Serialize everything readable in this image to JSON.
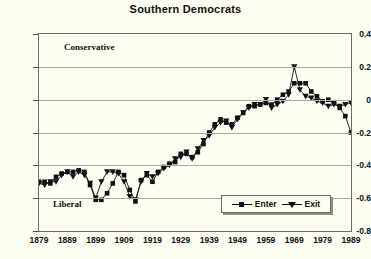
{
  "chart_data": {
    "type": "line",
    "title": "Southern Democrats",
    "xlabel": "",
    "ylabel": "",
    "xlim": [
      1879,
      1989
    ],
    "ylim": [
      -0.8,
      0.4
    ],
    "yticks": [
      0.4,
      0.2,
      0,
      -0.2,
      -0.4,
      -0.6,
      -0.8
    ],
    "ytick_labels": [
      "0.4",
      "0.2",
      "0",
      "-0.2",
      "-0.4",
      "-0.6",
      "-0.8"
    ],
    "xticks": [
      1879,
      1889,
      1899,
      1909,
      1919,
      1929,
      1939,
      1949,
      1959,
      1969,
      1979,
      1989
    ],
    "xtick_labels": [
      "1879",
      "1889",
      "1899",
      "1909",
      "1919",
      "1929",
      "1939",
      "1949",
      "1959",
      "1969",
      "1979",
      "1989"
    ],
    "grid": "horizontal",
    "legend_position": "inside-bottom-right",
    "annotations": [
      {
        "text": "Conservative",
        "x": 1888,
        "y": 0.33
      },
      {
        "text": "Liberal",
        "x": 1885,
        "y": -0.64
      }
    ],
    "series": [
      {
        "name": "Enter",
        "marker": "square",
        "x": [
          1879,
          1881,
          1883,
          1885,
          1887,
          1889,
          1891,
          1893,
          1895,
          1897,
          1899,
          1901,
          1903,
          1905,
          1907,
          1909,
          1911,
          1913,
          1915,
          1917,
          1919,
          1921,
          1923,
          1925,
          1927,
          1929,
          1931,
          1933,
          1935,
          1937,
          1939,
          1941,
          1943,
          1945,
          1947,
          1949,
          1951,
          1953,
          1955,
          1957,
          1959,
          1961,
          1963,
          1965,
          1967,
          1969,
          1971,
          1973,
          1975,
          1977,
          1979,
          1981,
          1983,
          1985,
          1987,
          1989
        ],
        "values": [
          -0.5,
          -0.5,
          -0.51,
          -0.47,
          -0.45,
          -0.44,
          -0.44,
          -0.43,
          -0.44,
          -0.52,
          -0.61,
          -0.61,
          -0.57,
          -0.51,
          -0.44,
          -0.46,
          -0.55,
          -0.62,
          -0.49,
          -0.46,
          -0.5,
          -0.44,
          -0.41,
          -0.39,
          -0.38,
          -0.33,
          -0.33,
          -0.35,
          -0.32,
          -0.27,
          -0.2,
          -0.15,
          -0.12,
          -0.14,
          -0.15,
          -0.11,
          -0.08,
          -0.04,
          -0.04,
          -0.03,
          -0.02,
          -0.03,
          0.0,
          0.03,
          0.05,
          0.1,
          0.1,
          0.1,
          0.05,
          0.02,
          -0.01,
          0.0,
          -0.02,
          -0.05,
          -0.1,
          -0.2
        ]
      },
      {
        "name": "Exit",
        "marker": "triangle-down",
        "x": [
          1879,
          1881,
          1883,
          1885,
          1887,
          1889,
          1891,
          1893,
          1895,
          1897,
          1899,
          1901,
          1903,
          1905,
          1907,
          1909,
          1911,
          1913,
          1915,
          1917,
          1919,
          1921,
          1923,
          1925,
          1927,
          1929,
          1931,
          1933,
          1935,
          1937,
          1939,
          1941,
          1943,
          1945,
          1947,
          1949,
          1951,
          1953,
          1955,
          1957,
          1959,
          1961,
          1963,
          1965,
          1967,
          1969,
          1971,
          1973,
          1975,
          1977,
          1979,
          1981,
          1983,
          1985,
          1987,
          1989
        ],
        "values": [
          -0.51,
          -0.52,
          -0.5,
          -0.5,
          -0.46,
          -0.44,
          -0.47,
          -0.44,
          -0.46,
          -0.51,
          -0.6,
          -0.5,
          -0.44,
          -0.44,
          -0.45,
          -0.5,
          -0.59,
          -0.61,
          -0.5,
          -0.45,
          -0.47,
          -0.45,
          -0.42,
          -0.4,
          -0.36,
          -0.35,
          -0.32,
          -0.36,
          -0.3,
          -0.25,
          -0.22,
          -0.17,
          -0.14,
          -0.13,
          -0.17,
          -0.12,
          -0.08,
          -0.05,
          -0.03,
          -0.03,
          0.0,
          -0.05,
          -0.03,
          -0.01,
          0.03,
          0.2,
          0.06,
          0.02,
          0.01,
          -0.01,
          -0.02,
          -0.04,
          -0.03,
          -0.04,
          -0.03,
          -0.02
        ]
      }
    ]
  },
  "legend": {
    "entries": [
      {
        "label": "Enter"
      },
      {
        "label": "Exit"
      }
    ]
  }
}
